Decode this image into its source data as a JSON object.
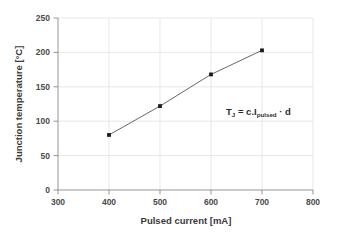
{
  "chart_data": {
    "type": "line",
    "title": "",
    "xlabel": "Pulsed current [mA]",
    "ylabel": "Junction temperature [°C]",
    "xlim": [
      300,
      800
    ],
    "ylim": [
      0,
      250
    ],
    "xticks": [
      300,
      400,
      500,
      600,
      700,
      800
    ],
    "yticks": [
      0,
      50,
      100,
      150,
      200,
      250
    ],
    "xtick_labels": [
      "300",
      "400",
      "500",
      "600",
      "700",
      "800"
    ],
    "ytick_labels": [
      "0",
      "50",
      "100",
      "150",
      "200",
      "250"
    ],
    "grid": true,
    "legend": false,
    "marker": "square",
    "line_color": "#555555",
    "marker_color": "#1a1a1a",
    "grid_color": "#d9d9d9",
    "axis_color": "#8a8a8a",
    "series": [
      {
        "name": "Junction temperature",
        "x": [
          400,
          500,
          600,
          700
        ],
        "values": [
          80,
          122,
          168,
          203
        ]
      }
    ],
    "annotations": [
      {
        "name": "equation",
        "x": 640,
        "y": 130,
        "parts": {
          "lead": "T",
          "lead_sub": "J",
          "eq": " = c.I",
          "eq_sub": "pulsed",
          "tail": " · d"
        },
        "text": "T_J = c.I_pulsed · d"
      }
    ]
  }
}
